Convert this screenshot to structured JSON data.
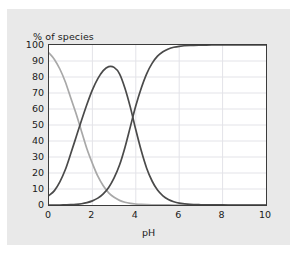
{
  "figure": {
    "background_color": "#e9e9e9",
    "plot_background_color": "#ffffff",
    "frame_color": "#3b3b3b",
    "grid_color": "#e3e3e8"
  },
  "chart_data": {
    "type": "line",
    "title": "",
    "subtitle": "",
    "xlabel": "pH",
    "ylabel": "% of species",
    "xlim": [
      0,
      10
    ],
    "ylim": [
      0,
      100
    ],
    "grid": true,
    "legend": "none",
    "xticks": [
      0,
      2,
      4,
      6,
      8,
      10
    ],
    "xtick_labels": [
      "0",
      "2",
      "4",
      "6",
      "8",
      "10"
    ],
    "yticks": [
      0,
      10,
      20,
      30,
      40,
      50,
      60,
      70,
      80,
      90,
      100
    ],
    "ytick_labels": [
      "0",
      "10",
      "20",
      "30",
      "40",
      "50",
      "60",
      "70",
      "80",
      "90",
      "100"
    ],
    "x": [
      0.0,
      0.25,
      0.5,
      0.75,
      1.0,
      1.25,
      1.5,
      1.75,
      2.0,
      2.25,
      2.5,
      2.75,
      3.0,
      3.25,
      3.5,
      3.75,
      4.0,
      4.25,
      4.5,
      4.75,
      5.0,
      5.25,
      5.5,
      5.75,
      6.0,
      6.5,
      7.0,
      7.5,
      8.0,
      8.5,
      9.0,
      9.5,
      10.0
    ],
    "series": [
      {
        "name": "fully protonated species",
        "color": "#a8a8a8",
        "values": [
          95,
          91,
          85,
          77,
          67,
          57,
          46,
          35,
          26,
          18,
          12,
          7.6,
          4.8,
          2.9,
          1.7,
          1.0,
          0.6,
          0.33,
          0.19,
          0.11,
          0.06,
          0.035,
          0.02,
          0.011,
          0.006,
          0.002,
          0.001,
          0.0,
          0.0,
          0.0,
          0.0,
          0.0,
          0.0
        ]
      },
      {
        "name": "singly deprotonated species",
        "color": "#4a4a4a",
        "values": [
          6,
          9,
          14.5,
          22,
          32,
          42.5,
          53,
          63,
          72,
          79,
          84,
          86.5,
          86,
          82,
          73,
          61,
          47,
          34,
          23,
          15,
          9.3,
          5.7,
          3.4,
          2.0,
          1.2,
          0.4,
          0.15,
          0.05,
          0.02,
          0.0,
          0.0,
          0.0,
          0.0
        ]
      },
      {
        "name": "fully deprotonated species",
        "color": "#4a4a4a",
        "values": [
          0.0,
          0.0,
          0.0,
          0.1,
          0.2,
          0.4,
          0.8,
          1.5,
          2.6,
          4.3,
          7.0,
          11,
          17,
          25,
          36,
          49,
          62,
          73,
          82,
          88.5,
          93,
          95.8,
          97.5,
          98.6,
          99.2,
          99.7,
          99.9,
          100,
          100,
          100,
          100,
          100,
          100
        ]
      }
    ],
    "annotations": [
      {
        "label": "curve-1 / curve-2 crossover",
        "x": 1.42,
        "y": 50
      },
      {
        "label": "curve-2 / curve-3 crossover",
        "x": 3.55,
        "y": 50
      },
      {
        "label": "curve-2 maximum",
        "x": 2.6,
        "y": 87
      }
    ]
  }
}
